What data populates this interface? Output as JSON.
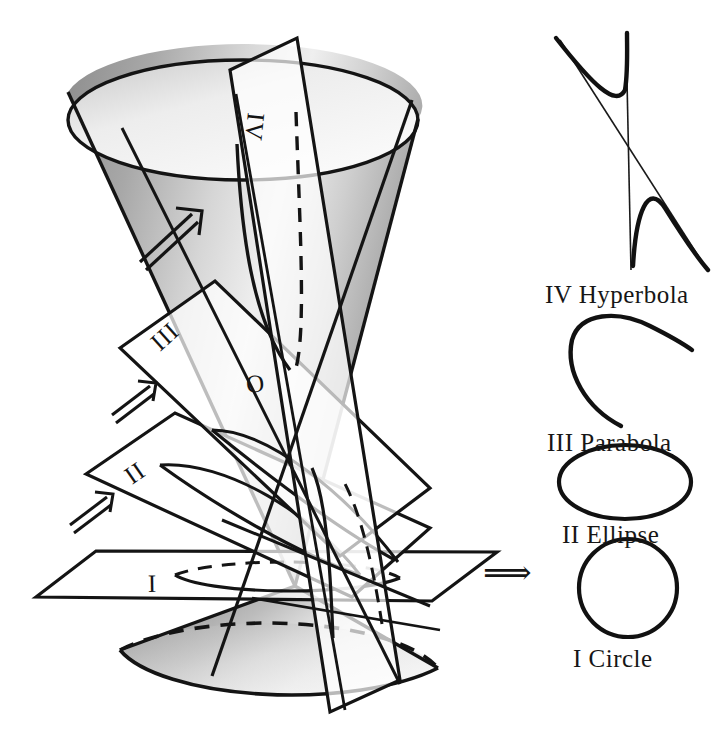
{
  "figure": {
    "apex_label": "O",
    "background_color": "#ffffff",
    "ink_color": "#141414",
    "transition_arrow": "⟹"
  },
  "cutting_planes": [
    {
      "id": "I",
      "label": "I",
      "conic": "Circle",
      "orientation": "horizontal"
    },
    {
      "id": "II",
      "label": "II",
      "conic": "Ellipse",
      "orientation": "oblique, cuts one nappe"
    },
    {
      "id": "III",
      "label": "III",
      "conic": "Parabola",
      "orientation": "parallel to a generator"
    },
    {
      "id": "IV",
      "label": "IV",
      "conic": "Hyperbola",
      "orientation": "vertical, cuts both nappes"
    }
  ],
  "legend": {
    "items": [
      {
        "numeral": "IV",
        "name": "Hyperbola",
        "caption": "IV  Hyperbola",
        "shape": "hyperbola"
      },
      {
        "numeral": "III",
        "name": "Parabola",
        "caption": "III  Parabola",
        "shape": "parabola"
      },
      {
        "numeral": "II",
        "name": "Ellipse",
        "caption": "II  Ellipse",
        "shape": "ellipse"
      },
      {
        "numeral": "I",
        "name": "Circle",
        "caption": "I  Circle",
        "shape": "circle"
      }
    ]
  },
  "arrows": {
    "plane_ii_arrow": "⇗",
    "plane_iii_arrow": "⇗",
    "cone_arrow": "↗",
    "legend_arrow": "⟹"
  }
}
